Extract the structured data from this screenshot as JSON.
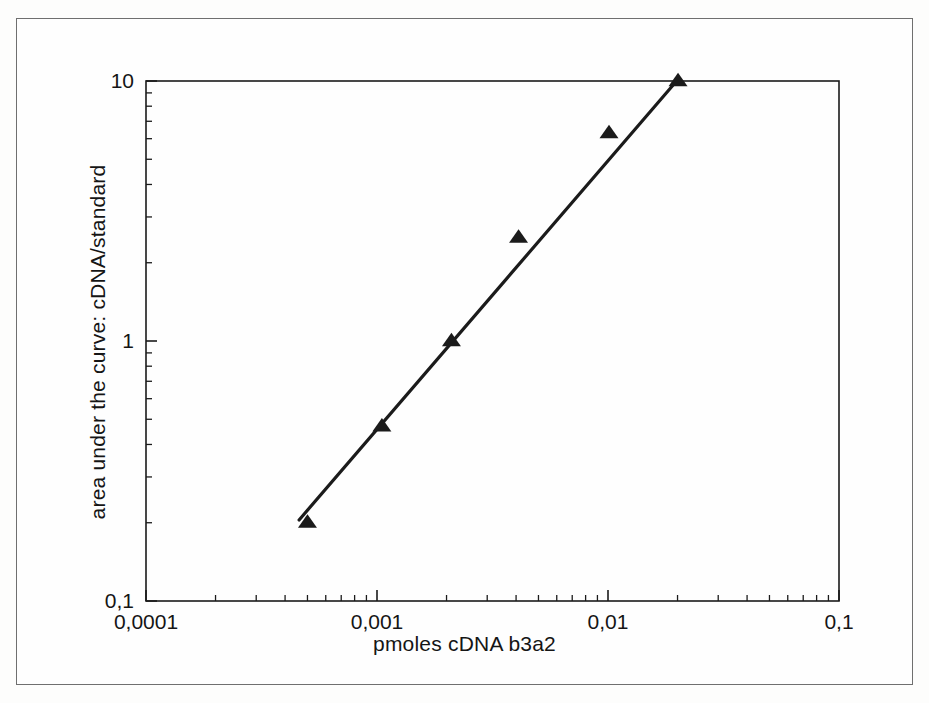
{
  "figure": {
    "background_color": "#fdfdfc",
    "ink_color": "#1b1b1b",
    "frame_color": "#6f6f6f"
  },
  "chart_data": {
    "type": "scatter",
    "title": "",
    "subtitle": "",
    "xlabel": "pmoles cDNA b3a2",
    "ylabel": "area under the curve: cDNA/standard",
    "xscale": "log",
    "yscale": "log",
    "xlim": [
      0.0001,
      0.1
    ],
    "ylim": [
      0.1,
      10
    ],
    "grid": false,
    "legend": null,
    "x_tick_labels": [
      "0,0001",
      "0,001",
      "0,01",
      "0,1"
    ],
    "x_tick_values": [
      0.0001,
      0.001,
      0.01,
      0.1
    ],
    "y_tick_labels": [
      "0,1",
      "1",
      "10"
    ],
    "y_tick_values": [
      0.1,
      1,
      10
    ],
    "minor_ticks": true,
    "decimal_separator": ",",
    "series": [
      {
        "name": "standard curve",
        "marker": "triangle-up",
        "marker_color": "#1b1b1b",
        "x": [
          0.0005,
          0.00105,
          0.0021,
          0.0041,
          0.0101,
          0.0201
        ],
        "y": [
          0.2,
          0.47,
          1.0,
          2.5,
          6.3,
          10.0
        ]
      },
      {
        "name": "regression line",
        "type": "line",
        "line_color": "#1b1b1b",
        "x": [
          0.00046,
          0.0202
        ],
        "y": [
          0.205,
          10.2
        ]
      }
    ],
    "annotations": []
  }
}
